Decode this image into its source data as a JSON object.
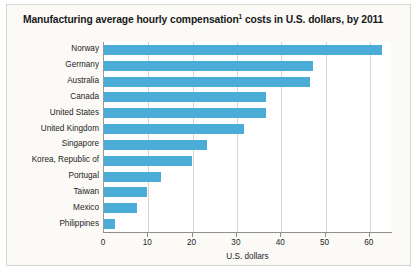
{
  "chart_data": {
    "type": "bar",
    "orientation": "horizontal",
    "title": "Manufacturing average hourly compensation",
    "title_superscript": "1",
    "title_suffix": " costs in U.S. dollars, by 2011",
    "xlabel": "U.S. dollars",
    "ylabel": "",
    "xlim": [
      0,
      65
    ],
    "xticks": [
      0,
      10,
      20,
      30,
      40,
      50,
      60
    ],
    "xtick_labels": [
      "0",
      "10",
      "20",
      "30",
      "40",
      "50",
      "60"
    ],
    "grid": "vertical",
    "legend": "none",
    "bar_color": "#4bacd8",
    "categories": [
      "Norway",
      "Germany",
      "Australia",
      "Canada",
      "United States",
      "United Kingdom",
      "Singapore",
      "Korea, Republic of",
      "Portugal",
      "Taiwan",
      "Mexico",
      "Philippines"
    ],
    "values": [
      62.8,
      47.2,
      46.5,
      36.6,
      36.5,
      31.5,
      23.3,
      19.8,
      12.8,
      9.8,
      7.4,
      2.4
    ]
  },
  "colors": {
    "bar": "#4bacd8",
    "frame": "#d8d6cf",
    "panel_background": "#fbfaf7",
    "plot_background": "#ffffff",
    "gridline": "#d5d5d2",
    "axis": "#8f8f8b",
    "text": "#1d1d1d"
  }
}
